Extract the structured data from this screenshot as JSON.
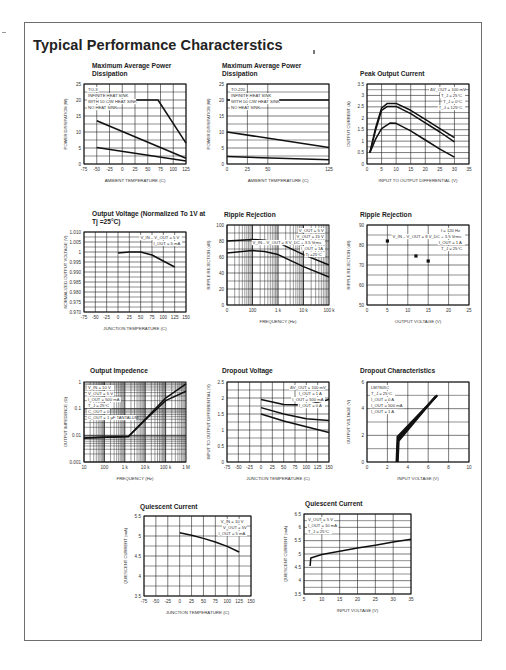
{
  "page": {
    "title": "Typical Performance Characterstics"
  },
  "chart_data": [
    {
      "id": "max-power-to3",
      "type": "line",
      "title": "Maximum Average Power Dissipation",
      "xlabel": "AMBIENT TEMPERATURE (C)",
      "ylabel": "POWER DISSIPATION (W)",
      "x_ticks": [
        -75,
        -50,
        -25,
        0,
        25,
        50,
        75,
        100,
        125
      ],
      "y_ticks": [
        0,
        5,
        10,
        15,
        20,
        25
      ],
      "xlim": [
        -75,
        125
      ],
      "ylim": [
        0,
        25
      ],
      "grid": true,
      "annotations": [
        "TO-3",
        "INFINITE HEAT SINK",
        "WITH 10 C/W HEAT SINK",
        "NO HEAT SINK"
      ],
      "series": [
        {
          "name": "INFINITE HEAT SINK",
          "x": [
            -50,
            70,
            125
          ],
          "y": [
            20,
            20,
            6.5
          ]
        },
        {
          "name": "WITH 10 C/W HEAT SINK",
          "x": [
            -50,
            125
          ],
          "y": [
            13.5,
            1.8
          ]
        },
        {
          "name": "NO HEAT SINK",
          "x": [
            -50,
            125
          ],
          "y": [
            5.2,
            0.9
          ]
        }
      ]
    },
    {
      "id": "max-power-to220",
      "type": "line",
      "title": "Maximum Average Power Dissipation",
      "xlabel": "AMBIENT TEMPERATURE (C)",
      "ylabel": "POWER DISSIPATION (W)",
      "x_ticks": [
        0,
        25,
        50,
        125
      ],
      "y_ticks": [
        0,
        5,
        10,
        15,
        20,
        25
      ],
      "xlim": [
        0,
        125
      ],
      "ylim": [
        0,
        25
      ],
      "grid": true,
      "annotations": [
        "TO-220",
        "INFINITE HEAT SINK",
        "WITH 10 C/W HEAT SINK",
        "NO HEAT SINK"
      ],
      "series": [
        {
          "name": "INFINITE HEAT SINK",
          "x": [
            0,
            125
          ],
          "y": [
            20,
            20
          ]
        },
        {
          "name": "WITH 10 C/W HEAT SINK",
          "x": [
            0,
            125
          ],
          "y": [
            10,
            5.2
          ]
        },
        {
          "name": "NO HEAT SINK",
          "x": [
            0,
            125
          ],
          "y": [
            2.3,
            1.3
          ]
        }
      ]
    },
    {
      "id": "peak-output-current",
      "type": "line",
      "title": "Peak Output Current",
      "xlabel": "INPUT TO OUTPUT DIFFERENTIAL (V)",
      "ylabel": "OUTPUT CURRENT (A)",
      "x_ticks": [
        0,
        5,
        10,
        15,
        20,
        25,
        30,
        35
      ],
      "y_ticks": [
        0,
        0.5,
        1,
        1.5,
        2,
        2.5,
        3,
        3.5
      ],
      "xlim": [
        0,
        35
      ],
      "ylim": [
        0,
        3.5
      ],
      "grid": true,
      "annotations": [
        "ΔV_OUT = 100 mV",
        "T_J = 25°C",
        "T_J = 0°C",
        "T_J = 125°C"
      ],
      "series": [
        {
          "name": "T_J = 0°C",
          "x": [
            1,
            3,
            5,
            7,
            10,
            15,
            20,
            25,
            30
          ],
          "y": [
            0.5,
            1.6,
            2.45,
            2.65,
            2.65,
            2.35,
            1.95,
            1.55,
            1.15
          ]
        },
        {
          "name": "T_J = 25°C",
          "x": [
            1,
            3,
            5,
            7,
            10,
            15,
            20,
            25,
            30
          ],
          "y": [
            0.5,
            1.5,
            2.35,
            2.52,
            2.52,
            2.2,
            1.8,
            1.4,
            0.97
          ]
        },
        {
          "name": "T_J = 125°C",
          "x": [
            1,
            3,
            5,
            8,
            10,
            15,
            20,
            25,
            30
          ],
          "y": [
            0.5,
            1.1,
            1.55,
            1.8,
            1.78,
            1.45,
            1.05,
            0.65,
            0.3
          ]
        }
      ]
    },
    {
      "id": "output-voltage-normalized",
      "type": "line",
      "title": "Output Voltage (Normalized To 1V at Tj =25°C)",
      "xlabel": "JUNCTION TEMPERATURE (C)",
      "ylabel": "NORMALIZED OUTPUT VOLTAGE (V)",
      "x_ticks": [
        -75,
        -50,
        -25,
        0,
        25,
        50,
        75,
        100,
        125,
        150
      ],
      "y_ticks": [
        0.97,
        0.975,
        0.98,
        0.985,
        0.99,
        0.995,
        1,
        1.005,
        1.01
      ],
      "y_tick_labels": [
        "0.970",
        "0.975",
        "0.980",
        "0.985",
        "0.990",
        "0.995",
        "1",
        "1.005",
        "1.010"
      ],
      "xlim": [
        -75,
        150
      ],
      "ylim": [
        0.97,
        1.01
      ],
      "grid": true,
      "annotations": [
        "V_IN – V_OUT = 5 V",
        "I_OUT = 5 mA"
      ],
      "series": [
        {
          "name": "Normalized V_OUT",
          "x": [
            0,
            25,
            50,
            75,
            100,
            125
          ],
          "y": [
            0.9995,
            1.0,
            1.0,
            0.9985,
            0.9955,
            0.9925
          ]
        }
      ]
    },
    {
      "id": "ripple-rejection-frequency",
      "type": "line",
      "title": "Ripple Rejection",
      "xlabel": "FREQUENCY (Hz)",
      "ylabel": "RIPPLE REJECTION (dB)",
      "x_ticks": [
        "0",
        "100",
        "1 k",
        "10 k",
        "100 k"
      ],
      "y_ticks": [
        0,
        20,
        40,
        60,
        80,
        100
      ],
      "xscale": "log",
      "xlim": [
        10,
        100000
      ],
      "ylim": [
        0,
        100
      ],
      "grid": true,
      "annotations": [
        "V_OUT = 5 V",
        "V_OUT = 15 V",
        "V_IN – V_OUT = 8 V_DC + 3.5 Vrms",
        "I_OUT = 1A",
        "Tj =25°C"
      ],
      "series": [
        {
          "name": "V_OUT = 5 V",
          "x": [
            10,
            100,
            300,
            1000,
            10000,
            100000
          ],
          "y": [
            80,
            82,
            81,
            78,
            63,
            50
          ]
        },
        {
          "name": "V_OUT = 15 V",
          "x": [
            10,
            100,
            300,
            1000,
            10000,
            100000
          ],
          "y": [
            65,
            68,
            67,
            63,
            48,
            35
          ]
        }
      ]
    },
    {
      "id": "ripple-rejection-voltage",
      "type": "scatter",
      "title": "Ripple Rejection",
      "xlabel": "OUTPUT VOLTAGE (V)",
      "ylabel": "RIPPLE REJECTION (dB)",
      "x_ticks": [
        0,
        5,
        10,
        15,
        20,
        25
      ],
      "y_ticks": [
        50,
        60,
        70,
        80,
        90
      ],
      "xlim": [
        0,
        25
      ],
      "ylim": [
        50,
        90
      ],
      "grid": true,
      "annotations": [
        "f = 120 Hz",
        "V_IN – V_OUT = 8 V_DC + 3.5 Vrms",
        "I_OUT = 1 A",
        "T_J = 25°C"
      ],
      "series": [
        {
          "name": "Rejection",
          "x": [
            5,
            12,
            15
          ],
          "y": [
            82,
            74.5,
            72
          ]
        }
      ]
    },
    {
      "id": "output-impedance",
      "type": "line",
      "title": "Output Impedence",
      "xlabel": "FREQUENCY (Hz)",
      "ylabel": "OUTPUT IMPEDENCE (Ω)",
      "x_ticks": [
        "10",
        "100",
        "1 k",
        "10 k",
        "100 k",
        "1 M"
      ],
      "y_ticks": [
        "0.001",
        "0.01",
        "0.1",
        "1"
      ],
      "xscale": "log",
      "yscale": "log",
      "xlim": [
        10,
        1000000
      ],
      "ylim": [
        0.001,
        1
      ],
      "grid": true,
      "annotations": [
        "V_IN = 10 V",
        "V_OUT = 5 V",
        "I_OUT = 500 mA",
        "T_J = 25°C",
        "C_OUT = 0",
        "C_OUT = 1 µF TANTALUM"
      ],
      "series": [
        {
          "name": "C_OUT = 0",
          "x": [
            10,
            1500,
            10000,
            100000,
            1000000
          ],
          "y": [
            0.008,
            0.009,
            0.04,
            0.25,
            0.85
          ]
        },
        {
          "name": "C_OUT = 1 µF TANTALUM",
          "x": [
            10,
            1500,
            10000,
            100000,
            1000000
          ],
          "y": [
            0.008,
            0.009,
            0.038,
            0.2,
            0.45
          ]
        }
      ]
    },
    {
      "id": "dropout-voltage",
      "type": "line",
      "title": "Dropout Voltage",
      "xlabel": "JUNCTION TEMPERATURE (C)",
      "ylabel": "INPUT TO OUTPUT DIFFERENTIAL (V)",
      "x_ticks": [
        -75,
        -50,
        -25,
        0,
        25,
        50,
        75,
        100,
        125,
        150
      ],
      "y_ticks": [
        0,
        0.5,
        1,
        1.5,
        2,
        2.5
      ],
      "xlim": [
        -75,
        150
      ],
      "ylim": [
        0,
        2.5
      ],
      "grid": true,
      "annotations": [
        "ΔV_OUT = 100 mV",
        "I_OUT = 1 A",
        "I_OUT = 500 mA",
        "I_OUT = 0 A"
      ],
      "series": [
        {
          "name": "I_OUT = 1 A",
          "x": [
            0,
            50,
            100,
            150
          ],
          "y": [
            1.95,
            1.8,
            1.78,
            1.95
          ]
        },
        {
          "name": "I_OUT = 500 mA",
          "x": [
            0,
            50,
            100,
            150
          ],
          "y": [
            1.7,
            1.5,
            1.35,
            1.3
          ]
        },
        {
          "name": "I_OUT = 0 A",
          "x": [
            0,
            50,
            100,
            150
          ],
          "y": [
            1.5,
            1.28,
            1.1,
            0.92
          ]
        }
      ]
    },
    {
      "id": "dropout-characteristics",
      "type": "line",
      "title": "Dropout Characteristics",
      "xlabel": "INPUT VOLTAGE (V)",
      "ylabel": "OUTPUT VOLTAGE (V)",
      "x_ticks": [
        0,
        2,
        4,
        6,
        8,
        10
      ],
      "y_ticks": [
        0,
        2,
        4,
        6
      ],
      "xlim": [
        0,
        10
      ],
      "ylim": [
        0,
        6
      ],
      "grid": true,
      "annotations": [
        "LM7805C",
        "T_J = 25°C",
        "I_OUT = 0 A",
        "I_OUT = 500 mA",
        "I_OUT = 1 A"
      ],
      "series": [
        {
          "name": "I_OUT = 0 A",
          "x": [
            2.9,
            3.0,
            6.9
          ],
          "y": [
            0,
            1.9,
            5.0
          ]
        },
        {
          "name": "I_OUT = 500 mA",
          "x": [
            2.95,
            3.05,
            6.8
          ],
          "y": [
            0,
            1.75,
            4.95
          ]
        },
        {
          "name": "I_OUT = 1 A",
          "x": [
            3.0,
            3.1,
            6.7
          ],
          "y": [
            0,
            1.6,
            4.9
          ]
        }
      ]
    },
    {
      "id": "quiescent-current-temp",
      "type": "line",
      "title": "Quiescent Current",
      "xlabel": "JUNCTION TEMPERATURE (C)",
      "ylabel": "QUIESCENT CURRENT (mA)",
      "x_ticks": [
        -75,
        -50,
        -25,
        0,
        25,
        50,
        75,
        100,
        125,
        150
      ],
      "y_ticks": [
        3.5,
        4,
        4.5,
        5,
        5.5
      ],
      "xlim": [
        -75,
        150
      ],
      "ylim": [
        3.5,
        5.5
      ],
      "grid": true,
      "annotations": [
        "V_IN = 10 V",
        "V_OUT = 5V",
        "I_OUT = 5 mA"
      ],
      "series": [
        {
          "name": "I_Q",
          "x": [
            0,
            25,
            50,
            75,
            100,
            125
          ],
          "y": [
            5.08,
            5.02,
            4.94,
            4.85,
            4.74,
            4.6
          ]
        }
      ]
    },
    {
      "id": "quiescent-current-vin",
      "type": "line",
      "title": "Quiescent Current",
      "xlabel": "INPUT VOLTAGE (V)",
      "ylabel": "QUIESCENT CURRENT (mA)",
      "x_ticks": [
        5,
        10,
        15,
        20,
        25,
        30,
        35
      ],
      "y_ticks": [
        3.5,
        4,
        4.5,
        5,
        5.5,
        6,
        6.5
      ],
      "xlim": [
        5,
        35
      ],
      "ylim": [
        3.5,
        6.5
      ],
      "grid": true,
      "annotations": [
        "V_OUT = 5 V",
        "I_OUT = 10 mA",
        "T_J = 25°C"
      ],
      "series": [
        {
          "name": "I_Q",
          "x": [
            6.7,
            6.9,
            10,
            15,
            20,
            25,
            30,
            35
          ],
          "y": [
            4.55,
            4.85,
            4.98,
            5.1,
            5.22,
            5.33,
            5.45,
            5.55
          ]
        }
      ]
    }
  ]
}
